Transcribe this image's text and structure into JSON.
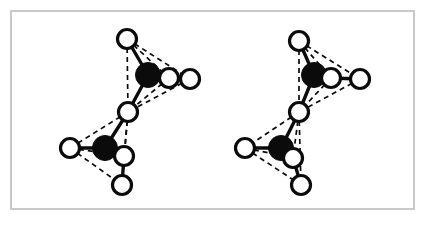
{
  "figure": {
    "background_color": "#ffffff",
    "frame": {
      "border_color": "#c9c9c9",
      "border_width_px": 2,
      "x": 10,
      "y": 10,
      "width": 405,
      "height": 200
    },
    "legend": {
      "dark_atom_label": "dark sphere",
      "light_atom_label": "open sphere",
      "solid_bond_label": "solid bond",
      "dashed_edge_label": "dashed tetrahedron edge"
    },
    "style": {
      "dark_atom_color": "#0b0b0b",
      "light_atom_fill": "#ffffff",
      "light_atom_stroke": "#0b0b0b",
      "bond_color": "#0b0b0b",
      "dash_pattern": "5 4"
    },
    "structures": [
      {
        "name": "left-structure",
        "label": "",
        "atoms": [
          {
            "id": "L-A1",
            "type": "dark",
            "cx": 148,
            "cy": 75,
            "r": 12.5
          },
          {
            "id": "L-A2",
            "type": "dark",
            "cx": 105,
            "cy": 148,
            "r": 12.5
          },
          {
            "id": "L-V1",
            "type": "light",
            "cx": 127,
            "cy": 39,
            "r": 9.5
          },
          {
            "id": "L-V2",
            "type": "light",
            "cx": 169,
            "cy": 78,
            "r": 9.5
          },
          {
            "id": "L-V3",
            "type": "light",
            "cx": 190,
            "cy": 79,
            "r": 9.5
          },
          {
            "id": "L-BR",
            "type": "light",
            "cx": 128,
            "cy": 112,
            "r": 9.5
          },
          {
            "id": "L-V4",
            "type": "light",
            "cx": 70,
            "cy": 148,
            "r": 9.5
          },
          {
            "id": "L-V5",
            "type": "light",
            "cx": 124,
            "cy": 156,
            "r": 9.5
          },
          {
            "id": "L-V6",
            "type": "light",
            "cx": 122,
            "cy": 185,
            "r": 9.5
          }
        ],
        "solid_bonds": [
          [
            "L-A1",
            "L-V1"
          ],
          [
            "L-A1",
            "L-V2"
          ],
          [
            "L-V2",
            "L-V3"
          ],
          [
            "L-A1",
            "L-BR"
          ],
          [
            "L-A2",
            "L-BR"
          ],
          [
            "L-A2",
            "L-V4"
          ],
          [
            "L-A2",
            "L-V5"
          ],
          [
            "L-V5",
            "L-V6"
          ]
        ],
        "dashed_edges": [
          [
            "L-V1",
            "L-V2"
          ],
          [
            "L-V1",
            "L-V3"
          ],
          [
            "L-V1",
            "L-BR"
          ],
          [
            "L-V2",
            "L-BR"
          ],
          [
            "L-V3",
            "L-BR"
          ],
          [
            "L-A1",
            "L-V3"
          ],
          [
            "L-BR",
            "L-V4"
          ],
          [
            "L-BR",
            "L-V5"
          ],
          [
            "L-BR",
            "L-V6"
          ],
          [
            "L-V4",
            "L-V5"
          ],
          [
            "L-V4",
            "L-V6"
          ],
          [
            "L-V5",
            "L-V6"
          ]
        ]
      },
      {
        "name": "right-structure",
        "label": "",
        "atoms": [
          {
            "id": "R-A1",
            "type": "dark",
            "cx": 314,
            "cy": 75,
            "r": 12.5
          },
          {
            "id": "R-A2",
            "type": "dark",
            "cx": 281,
            "cy": 148,
            "r": 12.5
          },
          {
            "id": "R-V1",
            "type": "light",
            "cx": 299,
            "cy": 41,
            "r": 9.5
          },
          {
            "id": "R-V2",
            "type": "light",
            "cx": 331,
            "cy": 78,
            "r": 9.5
          },
          {
            "id": "R-V3",
            "type": "light",
            "cx": 360,
            "cy": 79,
            "r": 9.5
          },
          {
            "id": "R-BR",
            "type": "light",
            "cx": 299,
            "cy": 112,
            "r": 9.5
          },
          {
            "id": "R-V4",
            "type": "light",
            "cx": 245,
            "cy": 148,
            "r": 9.5
          },
          {
            "id": "R-V5",
            "type": "light",
            "cx": 293,
            "cy": 158,
            "r": 9.5
          },
          {
            "id": "R-V6",
            "type": "light",
            "cx": 301,
            "cy": 185,
            "r": 9.5
          }
        ],
        "solid_bonds": [
          [
            "R-A1",
            "R-V1"
          ],
          [
            "R-A1",
            "R-V2"
          ],
          [
            "R-V2",
            "R-V3"
          ],
          [
            "R-A1",
            "R-BR"
          ],
          [
            "R-A2",
            "R-BR"
          ],
          [
            "R-A2",
            "R-V4"
          ],
          [
            "R-A2",
            "R-V5"
          ],
          [
            "R-V5",
            "R-V6"
          ]
        ],
        "dashed_edges": [
          [
            "R-V1",
            "R-V2"
          ],
          [
            "R-V1",
            "R-V3"
          ],
          [
            "R-V1",
            "R-BR"
          ],
          [
            "R-V2",
            "R-BR"
          ],
          [
            "R-V3",
            "R-BR"
          ],
          [
            "R-BR",
            "R-V4"
          ],
          [
            "R-BR",
            "R-V5"
          ],
          [
            "R-BR",
            "R-V6"
          ],
          [
            "R-V4",
            "R-V5"
          ],
          [
            "R-V4",
            "R-V6"
          ],
          [
            "R-V5",
            "R-V6"
          ]
        ]
      }
    ]
  }
}
